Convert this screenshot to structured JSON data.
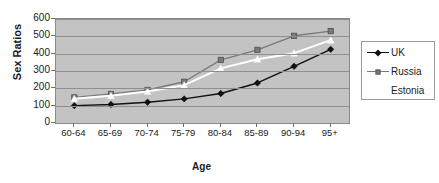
{
  "chart_data": {
    "type": "line",
    "title": "",
    "xlabel": "Age",
    "ylabel": "Sex Ratios",
    "categories": [
      "60-64",
      "65-69",
      "70-74",
      "75-79",
      "80-84",
      "85-89",
      "90-94",
      "95+"
    ],
    "ylim": [
      0,
      600
    ],
    "yticks": [
      0,
      100,
      200,
      300,
      400,
      500,
      600
    ],
    "grid": true,
    "legend_position": "right",
    "plot_background": "#c3c3c3",
    "series": [
      {
        "name": "UK",
        "marker": "diamond",
        "color": "#111111",
        "values": [
          100,
          107,
          120,
          139,
          170,
          231,
          327,
          425
        ]
      },
      {
        "name": "Russia",
        "marker": "square",
        "color": "#7a7a7a",
        "values": [
          148,
          168,
          191,
          238,
          364,
          422,
          503,
          530
        ]
      },
      {
        "name": "Estonia",
        "marker": "triangle",
        "color": "#ffffff",
        "values": [
          140,
          157,
          182,
          218,
          315,
          368,
          403,
          478
        ]
      }
    ]
  },
  "axis": {
    "y_title": "Sex Ratios",
    "x_title": "Age",
    "y_tick_labels": [
      "600",
      "500",
      "400",
      "300",
      "200",
      "100",
      "0"
    ],
    "x_tick_labels": [
      "60-64",
      "65-69",
      "70-74",
      "75-79",
      "80-84",
      "85-89",
      "90-94",
      "95+"
    ]
  },
  "legend": {
    "items": [
      {
        "label": "UK",
        "marker": "diamond-marker",
        "has_swatch": true
      },
      {
        "label": "Russia",
        "marker": "square-marker",
        "has_swatch": true
      },
      {
        "label": "Estonia",
        "marker": "triangle-marker",
        "has_swatch": true
      }
    ]
  }
}
